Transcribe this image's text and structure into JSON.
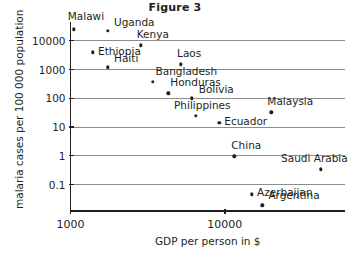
{
  "figure": {
    "title": "Figure 3"
  },
  "chart_data": {
    "type": "scatter",
    "title": "Figure 3",
    "xlabel": "GDP per person in $",
    "ylabel": "malaria cases per 100 000 population",
    "xscale": "log",
    "yscale": "log",
    "xlim": [
      1000,
      60000
    ],
    "ylim": [
      0.012,
      45000
    ],
    "grid": true,
    "legend": "none",
    "xticks": [
      1000,
      10000
    ],
    "xtick_labels": [
      "1000",
      "10000"
    ],
    "yticks": [
      0.1,
      1,
      10,
      100,
      1000,
      10000
    ],
    "ytick_labels": [
      "0.1",
      "1",
      "10",
      "100",
      "1000",
      "10000"
    ],
    "points": [
      {
        "label": "Malawi",
        "x": 1050,
        "y": 25000,
        "label_dx": -6,
        "label_dy": -12
      },
      {
        "label": "Uganda",
        "x": 1750,
        "y": 22000,
        "label_dx": 6,
        "label_dy": -8
      },
      {
        "label": "Kenya",
        "x": 2850,
        "y": 7000,
        "label_dx": -4,
        "label_dy": -10
      },
      {
        "label": "Ethiopia",
        "x": 1400,
        "y": 4000,
        "label_dx": 5,
        "label_dy": 0
      },
      {
        "label": "Haiti",
        "x": 1750,
        "y": 1200,
        "label_dx": 6,
        "label_dy": -8
      },
      {
        "label": "Laos",
        "x": 5200,
        "y": 1500,
        "label_dx": -4,
        "label_dy": -10
      },
      {
        "label": "Bangladesh",
        "x": 3400,
        "y": 380,
        "label_dx": 3,
        "label_dy": -10
      },
      {
        "label": "Honduras",
        "x": 4300,
        "y": 150,
        "label_dx": 2,
        "label_dy": -10
      },
      {
        "label": "Bolivia",
        "x": 6100,
        "y": 100,
        "label_dx": 7,
        "label_dy": -8
      },
      {
        "label": "Philippines",
        "x": 6500,
        "y": 25,
        "label_dx": -22,
        "label_dy": -10
      },
      {
        "label": "Ecuador",
        "x": 9200,
        "y": 14,
        "label_dx": 5,
        "label_dy": -1
      },
      {
        "label": "Malaysia",
        "x": 20000,
        "y": 33,
        "label_dx": -4,
        "label_dy": -10
      },
      {
        "label": "China",
        "x": 11500,
        "y": 0.95,
        "label_dx": -3,
        "label_dy": -10
      },
      {
        "label": "Saudi Arabia",
        "x": 42000,
        "y": 0.34,
        "label_dx": -40,
        "label_dy": -10
      },
      {
        "label": "Azerbaijan",
        "x": 15000,
        "y": 0.046,
        "label_dx": 5,
        "label_dy": -1
      },
      {
        "label": "Argentina",
        "x": 17500,
        "y": 0.019,
        "label_dx": 6,
        "label_dy": -9
      }
    ]
  }
}
